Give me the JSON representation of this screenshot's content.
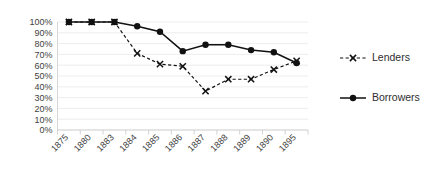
{
  "chart_data": {
    "type": "line",
    "title": "",
    "xlabel": "",
    "ylabel": "",
    "categories": [
      "1875",
      "1880",
      "1883",
      "1884",
      "1885",
      "1886",
      "1887",
      "1888",
      "1889",
      "1890",
      "1895"
    ],
    "ylim": [
      0,
      100
    ],
    "ytick_labels": [
      "100%",
      "90%",
      "80%",
      "70%",
      "60%",
      "50%",
      "40%",
      "30%",
      "20%",
      "10%",
      "0%"
    ],
    "ytick_values": [
      100,
      90,
      80,
      70,
      60,
      50,
      40,
      30,
      20,
      10,
      0
    ],
    "grid": true,
    "legend_position": "right",
    "series": [
      {
        "name": "Lenders",
        "marker": "x",
        "linestyle": "dashed",
        "color": "#111111",
        "values": [
          100,
          100,
          100,
          71,
          61,
          59,
          36,
          47,
          47,
          56,
          64
        ]
      },
      {
        "name": "Borrowers",
        "marker": "circle",
        "linestyle": "solid",
        "color": "#111111",
        "values": [
          100,
          100,
          100,
          96,
          91,
          73,
          79,
          79,
          74,
          72,
          62
        ]
      }
    ]
  },
  "legend": {
    "items": [
      {
        "label": "Lenders"
      },
      {
        "label": "Borrowers"
      }
    ]
  }
}
